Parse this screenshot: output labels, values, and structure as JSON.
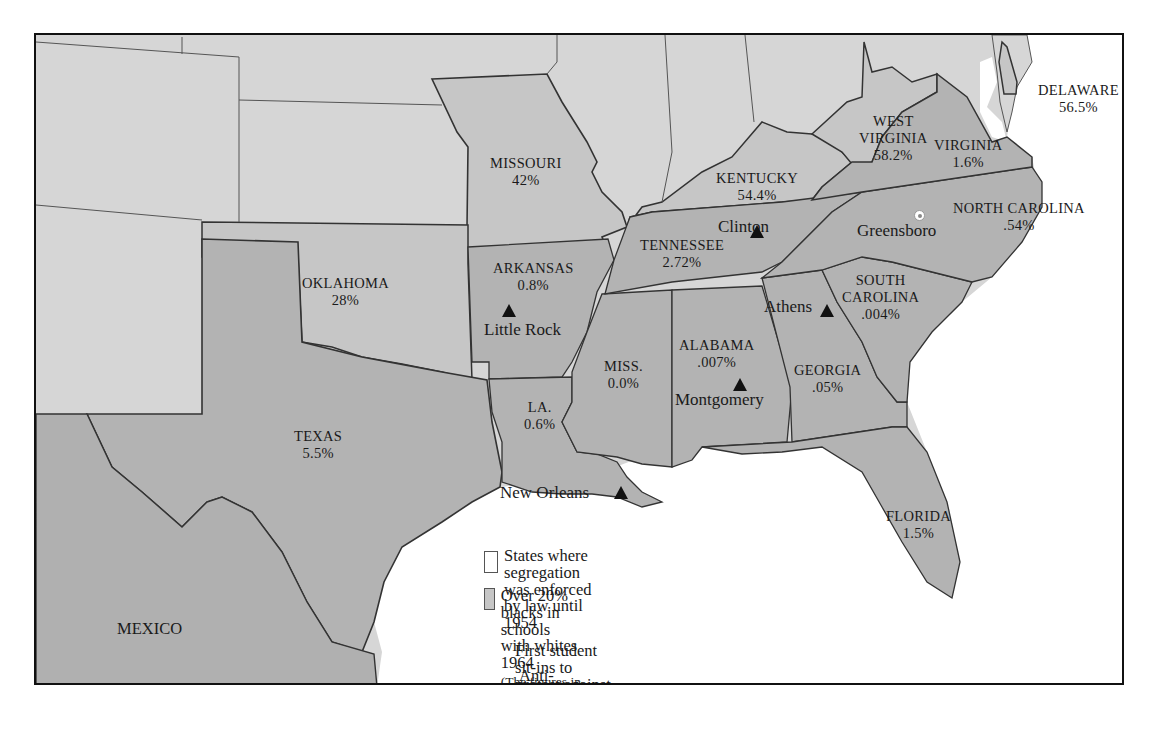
{
  "map": {
    "colors": {
      "non_segregated_state": "#d6d6d6",
      "over_20_percent_state": "#c6c6c6",
      "segregated_state": "#b3b3b3",
      "mexico": "#b0b0b0",
      "water": "#ffffff",
      "border": "#333333"
    },
    "states": [
      {
        "name": "DELAWARE",
        "value": "56.5%"
      },
      {
        "name": "WEST VIRGINIA",
        "line1": "WEST",
        "line2": "VIRGINIA",
        "value": "58.2%"
      },
      {
        "name": "VIRGINIA",
        "value": "1.6%"
      },
      {
        "name": "MISSOURI",
        "value": "42%"
      },
      {
        "name": "KENTUCKY",
        "value": "54.4%"
      },
      {
        "name": "NORTH CAROLINA",
        "value": ".54%"
      },
      {
        "name": "TENNESSEE",
        "value": "2.72%"
      },
      {
        "name": "OKLAHOMA",
        "value": "28%"
      },
      {
        "name": "ARKANSAS",
        "value": "0.8%"
      },
      {
        "name": "SOUTH CAROLINA",
        "line1": "SOUTH",
        "line2": "CAROLINA",
        "value": ".004%"
      },
      {
        "name": "ALABAMA",
        "value": ".007%"
      },
      {
        "name": "MISS.",
        "value": "0.0%"
      },
      {
        "name": "GEORGIA",
        "value": ".05%"
      },
      {
        "name": "LA.",
        "value": "0.6%"
      },
      {
        "name": "TEXAS",
        "value": "5.5%"
      },
      {
        "name": "FLORIDA",
        "value": "1.5%"
      }
    ],
    "country_labels": [
      "MEXICO"
    ],
    "cities": [
      {
        "name": "Clinton",
        "marker": "violence"
      },
      {
        "name": "Greensboro",
        "marker": "sit-in"
      },
      {
        "name": "Little Rock",
        "marker": "violence"
      },
      {
        "name": "Athens",
        "marker": "violence"
      },
      {
        "name": "Montgomery",
        "marker": "violence"
      },
      {
        "name": "New Orleans",
        "marker": "violence"
      }
    ]
  },
  "legend": {
    "items": [
      {
        "icon": "white-swatch",
        "text_line1": "States where segregation was enforced",
        "text_line2": "by law until 1954"
      },
      {
        "icon": "gray-swatch",
        "text_line1": "Over 20% blacks in schools with whites 1964",
        "note_line1": "(The figures in each state give percentage of blacks in",
        "note_line2": "schools with whites by 1964.)"
      },
      {
        "icon": "sit-in-marker",
        "text": "First student sit-ins to protest against lunch-counter discrimination, 1960"
      },
      {
        "icon": "triangle-marker",
        "text": "Anti-integration violence, 1955-1960"
      }
    ]
  }
}
